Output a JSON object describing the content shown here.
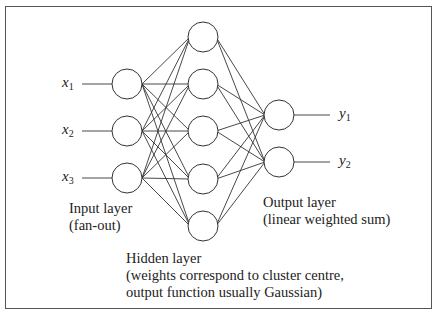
{
  "diagram": {
    "type": "rbf-neural-network",
    "inputs": [
      {
        "symbol": "x",
        "sub": "1"
      },
      {
        "symbol": "x",
        "sub": "2"
      },
      {
        "symbol": "x",
        "sub": "3"
      }
    ],
    "outputs": [
      {
        "symbol": "y",
        "sub": "1"
      },
      {
        "symbol": "y",
        "sub": "2"
      }
    ],
    "hidden_node_count": 5,
    "labels": {
      "input_layer_line1": "Input layer",
      "input_layer_line2": "(fan-out)",
      "output_layer_line1": "Output layer",
      "output_layer_line2": "(linear weighted sum)",
      "hidden_layer_line1": "Hidden layer",
      "hidden_layer_line2": "(weights correspond to cluster centre,",
      "hidden_layer_line3": "output function usually Gaussian)"
    },
    "colors": {
      "stroke": "#333333",
      "background": "#ffffff"
    }
  }
}
